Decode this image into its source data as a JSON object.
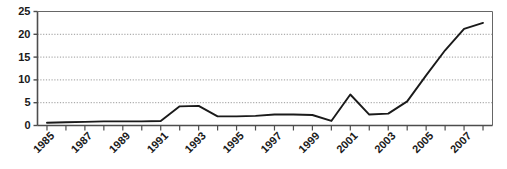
{
  "chart_data": {
    "type": "line",
    "title": "",
    "xlabel": "",
    "ylabel": "",
    "xlim": [
      1985,
      2008
    ],
    "ylim": [
      0,
      25
    ],
    "grid": true,
    "grid_axis": "y",
    "legend": "none",
    "line_color": "#1a1a1a",
    "grid_color": "#999999",
    "axis_color": "#666666",
    "yticks": [
      0,
      5,
      10,
      15,
      20,
      25
    ],
    "ytick_labels": [
      "0",
      "5",
      "10",
      "15",
      "20",
      "25"
    ],
    "xticks": [
      1985,
      1986,
      1987,
      1988,
      1989,
      1990,
      1991,
      1992,
      1993,
      1994,
      1995,
      1996,
      1997,
      1998,
      1999,
      2000,
      2001,
      2002,
      2003,
      2004,
      2005,
      2006,
      2007,
      2008
    ],
    "xtick_labels_shown": [
      "1985",
      "1987",
      "1989",
      "1991",
      "1993",
      "1995",
      "1997",
      "1999",
      "2001",
      "2003",
      "2005",
      "2007"
    ],
    "xtick_label_rotation": 45,
    "x": [
      1985,
      1986,
      1987,
      1988,
      1989,
      1990,
      1991,
      1992,
      1993,
      1994,
      1995,
      1996,
      1997,
      1998,
      1999,
      2000,
      2001,
      2002,
      2003,
      2004,
      2005,
      2006,
      2007,
      2008
    ],
    "values": [
      0.6,
      0.7,
      0.8,
      0.9,
      0.9,
      0.9,
      1.0,
      4.2,
      4.3,
      2.0,
      2.0,
      2.1,
      2.4,
      2.4,
      2.3,
      1.0,
      6.8,
      2.4,
      2.6,
      5.3,
      11.0,
      16.5,
      21.2,
      22.5
    ]
  }
}
